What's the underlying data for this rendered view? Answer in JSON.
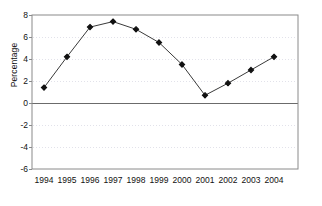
{
  "chart_data": {
    "type": "line",
    "title": "",
    "subtitle": "",
    "xlabel": "",
    "ylabel": "Percentage",
    "categories": [
      "1994",
      "1995",
      "1996",
      "1997",
      "1998",
      "1999",
      "2000",
      "2001",
      "2002",
      "2003",
      "2004"
    ],
    "values": [
      1.4,
      4.2,
      6.9,
      7.4,
      6.7,
      5.5,
      3.5,
      0.7,
      1.8,
      3.0,
      4.2
    ],
    "series": [
      {
        "name": "Percentage",
        "values": [
          1.4,
          4.2,
          6.9,
          7.4,
          6.7,
          5.5,
          3.5,
          0.7,
          1.8,
          3.0,
          4.2
        ]
      }
    ],
    "ylim": [
      -6,
      8
    ],
    "yticks": [
      8,
      6,
      4,
      2,
      0,
      -2,
      -4,
      -6
    ],
    "ytick_labels": [
      "8",
      "6",
      "4",
      "2",
      "0",
      "-2",
      "-4",
      "-6"
    ],
    "xlim": [
      "1994",
      "2004"
    ],
    "grid": true,
    "grid_style": "dotted",
    "zero_line": 0,
    "legend": false,
    "legend_position": "none",
    "marker": "filled-diamond",
    "annotations": []
  },
  "style": {
    "line_color": "#3a3a3a",
    "marker_color": "#111111",
    "frame_color": "#8a8a8a",
    "grid_color": "#e2e2ea",
    "zero_line_color": "#6b6b6b",
    "text_color": "#111111",
    "background": "#ffffff"
  }
}
